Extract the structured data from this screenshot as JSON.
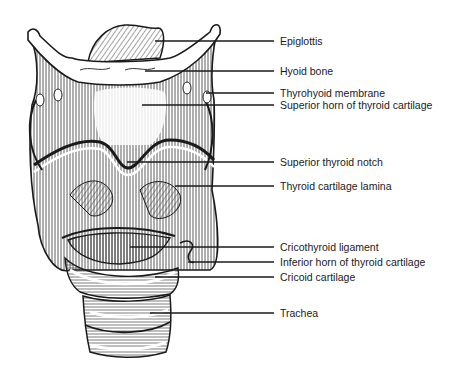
{
  "figure": {
    "colors": {
      "ink": "#1a1a1a",
      "shade": "#555555",
      "background": "#ffffff"
    }
  },
  "labels": [
    {
      "text": "Epiglottis",
      "y": 41,
      "x_start": 155
    },
    {
      "text": "Hyoid bone",
      "y": 71,
      "x_start": 145
    },
    {
      "text": "Thyrohyoid membrane",
      "y": 93,
      "x_start": 206
    },
    {
      "text": "Superior horn of thyroid cartilage",
      "y": 105,
      "x_start": 142
    },
    {
      "text": "Superior thyroid notch",
      "y": 162,
      "x_start": 127
    },
    {
      "text": "Thyroid cartilage lamina",
      "y": 186,
      "x_start": 175
    },
    {
      "text": "Cricothyroid ligament",
      "y": 247,
      "x_start": 130
    },
    {
      "text": "Inferior horn of thyroid cartilage",
      "y": 262,
      "x_start": 188
    },
    {
      "text": "Cricoid cartilage",
      "y": 277,
      "x_start": 155
    },
    {
      "text": "Trachea",
      "y": 313,
      "x_start": 150
    }
  ]
}
